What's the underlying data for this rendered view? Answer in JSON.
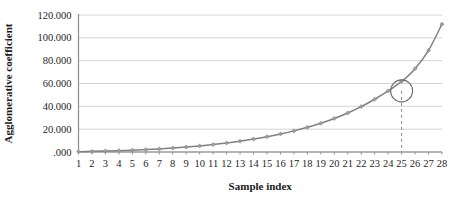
{
  "chart_data": {
    "type": "line",
    "title": "",
    "xlabel": "Sample index",
    "ylabel": "Agglomerative coefficient",
    "x": [
      1,
      2,
      3,
      4,
      5,
      6,
      7,
      8,
      9,
      10,
      11,
      12,
      13,
      14,
      15,
      16,
      17,
      18,
      19,
      20,
      21,
      22,
      23,
      24,
      25,
      26,
      27,
      28
    ],
    "categories": [
      "1",
      "2",
      "3",
      "4",
      "5",
      "6",
      "7",
      "8",
      "9",
      "10",
      "11",
      "12",
      "13",
      "14",
      "15",
      "16",
      "17",
      "18",
      "19",
      "20",
      "21",
      "22",
      "23",
      "24",
      "25",
      "26",
      "27",
      "28"
    ],
    "values": [
      0.3,
      0.6,
      0.9,
      1.2,
      1.6,
      2.1,
      2.7,
      3.4,
      4.3,
      5.3,
      6.5,
      7.9,
      9.5,
      11.3,
      13.4,
      15.8,
      18.5,
      21.6,
      25.2,
      29.4,
      34.2,
      39.8,
      46.2,
      53.5,
      61.8,
      73.0,
      89.0,
      112.0
    ],
    "series": [
      {
        "name": "Agglomerative coefficient",
        "values": [
          0.3,
          0.6,
          0.9,
          1.2,
          1.6,
          2.1,
          2.7,
          3.4,
          4.3,
          5.3,
          6.5,
          7.9,
          9.5,
          11.3,
          13.4,
          15.8,
          18.5,
          21.6,
          25.2,
          29.4,
          34.2,
          39.8,
          46.2,
          53.5,
          61.8,
          73.0,
          89.0,
          112.0
        ],
        "color": "#808080",
        "marker": "diamond"
      }
    ],
    "ylim": [
      0,
      120
    ],
    "xlim": [
      1,
      28
    ],
    "yticks": [
      0,
      20,
      40,
      60,
      80,
      100,
      120
    ],
    "ytick_labels": [
      ".000",
      "20.000",
      "40.000",
      "60.000",
      "80.000",
      "100.000",
      "120.000"
    ],
    "xticks": [
      1,
      2,
      3,
      4,
      5,
      6,
      7,
      8,
      9,
      10,
      11,
      12,
      13,
      14,
      15,
      16,
      17,
      18,
      19,
      20,
      21,
      22,
      23,
      24,
      25,
      26,
      27,
      28
    ],
    "grid": true,
    "grid_axis": "y",
    "legend": false,
    "legend_position": "none",
    "annotations": [
      {
        "type": "circle",
        "label": "elbow-highlight",
        "x": 25,
        "y": 53.5,
        "radius_px": 11,
        "color": "#6e6e6e"
      },
      {
        "type": "vline-dashed",
        "label": "elbow-drop-line",
        "x": 25,
        "y_from": 53.5,
        "y_to": 0,
        "color": "#8a8a8a"
      }
    ],
    "colors": {
      "series": "#808080",
      "grid": "#c9c9c9",
      "axis": "#8c8c8c",
      "annotation": "#6e6e6e",
      "text": "#262626",
      "background": "#ffffff"
    }
  }
}
